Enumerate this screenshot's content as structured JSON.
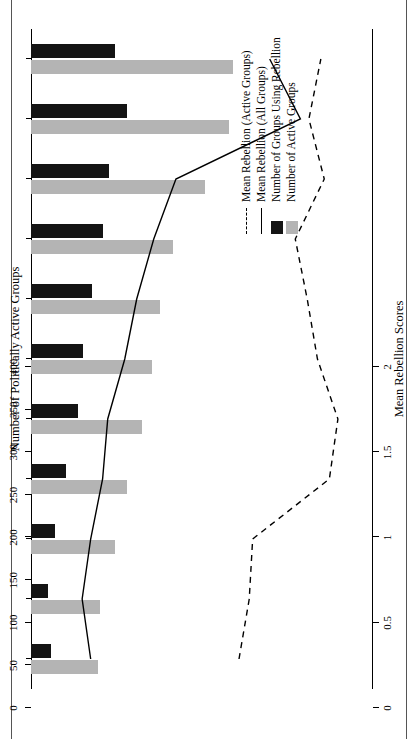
{
  "chart_data": {
    "type": "bar",
    "title": "Number of Politically Active Groups",
    "orientation": "horizontal",
    "categories": [
      "1945–49",
      "1950–54",
      "1955–59",
      "1960–64",
      "1965–69",
      "1970–74",
      "1975–79",
      "1980–84",
      "1985–89",
      "1990–94",
      "1995–98*"
    ],
    "xlabel": "Number of Politically Active Groups",
    "ylabel": "",
    "secondary_xlabel": "Mean Rebellion Scores",
    "xlim": [
      0,
      400
    ],
    "xticks": [
      0,
      50,
      100,
      150,
      200,
      250,
      300,
      350,
      400
    ],
    "secondary_xlim": [
      0,
      2
    ],
    "secondary_xticks": [
      0,
      0.5,
      1,
      1.5,
      2
    ],
    "grid": false,
    "legend_position": "bottom-left",
    "series": [
      {
        "name": "Number of Active Groups",
        "type": "bar",
        "color": "#b4b4b4",
        "axis": "counts",
        "values": [
          79,
          81,
          99,
          113,
          130,
          142,
          151,
          166,
          204,
          232,
          237
        ]
      },
      {
        "name": "Number of Groups Using Rebellion",
        "type": "bar",
        "color": "#141414",
        "axis": "counts",
        "values": [
          24,
          20,
          28,
          41,
          55,
          61,
          71,
          84,
          91,
          113,
          99
        ]
      },
      {
        "name": "Mean Rebellion (All Groups)",
        "type": "line",
        "style": "solid",
        "color": "#000000",
        "axis": "rebellion",
        "values": [
          0.35,
          0.3,
          0.35,
          0.42,
          0.45,
          0.55,
          0.62,
          0.72,
          0.85,
          1.58,
          1.4
        ]
      },
      {
        "name": "Mean Rebellion (Active Groups)",
        "type": "line",
        "style": "dashed",
        "color": "#000000",
        "axis": "rebellion",
        "values": [
          1.22,
          1.28,
          1.3,
          1.75,
          1.8,
          1.68,
          1.62,
          1.55,
          1.72,
          1.63,
          1.7
        ]
      }
    ]
  },
  "axis": {
    "top_title": "Number of Politically Active Groups",
    "bottom_title": "Mean Rebellion Scores",
    "top_ticks": [
      "400",
      "350",
      "300",
      "250",
      "200",
      "150",
      "100",
      "50",
      "0"
    ],
    "bottom_ticks": [
      "2",
      "1.5",
      "1",
      "0.5",
      "0"
    ]
  },
  "legend": {
    "items": [
      {
        "label": "Mean Rebellion (Active Groups)",
        "key": "dashed-line-key"
      },
      {
        "label": "Mean Rebellion (All Groups)",
        "key": "solid-line-key"
      },
      {
        "label": "Number of Groups Using Rebellion",
        "key": "black-swatch-key"
      },
      {
        "label": "Number of Active Groups",
        "key": "gray-swatch-key"
      }
    ]
  },
  "colors": {
    "active_groups_bar": "#b4b4b4",
    "rebellion_groups_bar": "#141414",
    "line": "#000000",
    "background": "#ffffff"
  }
}
